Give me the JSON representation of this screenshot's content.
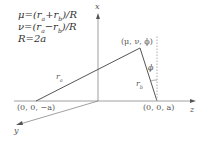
{
  "diagram": {
    "type": "prolate spheroidal coordinates geometry",
    "equations": [
      "μ=(r_a+r_b)/R",
      "ν=(r_a−r_b)/R",
      "R=2a"
    ],
    "eq1": "μ=(rₐ+rᵦ)/R",
    "eq2": "ν=(rₐ−rᵦ)/R",
    "eq3": "R=2a",
    "axes": {
      "x": "x",
      "y": "y",
      "z": "z"
    },
    "points": {
      "left_focus": "(0, 0, −a)",
      "right_focus": "(0, 0, a)",
      "field_point": "(μ, ν, ϕ)"
    },
    "segments": {
      "ra": "r",
      "ra_sub": "a",
      "rb": "r",
      "rb_sub": "b"
    },
    "angle": "ϕ",
    "colors": {
      "line": "#555555",
      "text": "#444444",
      "dotted": "#bbbbbb"
    }
  }
}
